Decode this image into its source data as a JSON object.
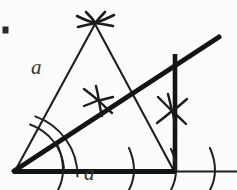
{
  "figure": {
    "background_color": "#fbfbf9",
    "ink_color": "#1b1b1b",
    "label_color": "#33322f",
    "labels": [
      {
        "name": "side-length",
        "text": "a",
        "x": 31,
        "y": 57
      },
      {
        "name": "base-length",
        "text": "a",
        "x": 84,
        "y": 163
      }
    ],
    "corner_mark": {
      "name": "crop-corner-mark",
      "x": 3,
      "y": 27,
      "size": 6
    },
    "geometry": {
      "vertex": {
        "x": 14,
        "y": 172
      },
      "apex": {
        "x": 95,
        "y": 23
      },
      "base_right": {
        "x": 175,
        "y": 172
      },
      "baseline_end": {
        "x": 237,
        "y": 172
      },
      "ray_end": {
        "x": 219,
        "y": 37
      },
      "perpendicular_top": {
        "x": 175,
        "y": 55
      },
      "thick_stroke_width": 5,
      "thin_stroke_width": 2.1,
      "arc_stroke_width": 1.8
    },
    "arc_marks": [
      {
        "name": "apex-arc-intersection",
        "x": 95,
        "y": 23
      },
      {
        "name": "bisector-midpoint-arc-intersection",
        "x": 98,
        "y": 100
      },
      {
        "name": "perpendicular-arc-intersection",
        "x": 172,
        "y": 110
      }
    ],
    "angle_arcs": [
      {
        "name": "vertex-angle-arc-outer",
        "radius": 62
      },
      {
        "name": "vertex-angle-arc-inner",
        "radius": 50
      }
    ],
    "base_tick_arcs": [
      {
        "name": "base-tick-arc-1",
        "x": 62,
        "y": 172
      },
      {
        "name": "base-tick-arc-2",
        "x": 133,
        "y": 172
      },
      {
        "name": "base-tick-arc-3",
        "x": 175,
        "y": 172
      },
      {
        "name": "base-tick-arc-4",
        "x": 214,
        "y": 172
      }
    ]
  }
}
